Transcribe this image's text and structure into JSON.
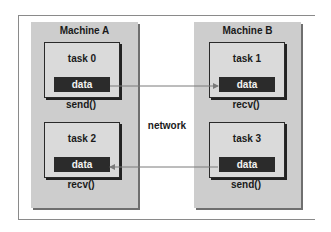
{
  "diagram": {
    "type": "message-passing",
    "network_label": "network",
    "colors": {
      "machine_fill": "#cdcdcd",
      "task_fill": "#dadada",
      "data_fill": "#2b2b2b",
      "arrow": "#7a7a7a"
    },
    "machines": [
      {
        "title": "Machine A",
        "tasks": [
          {
            "title": "task 0",
            "data": "data",
            "call": "send()"
          },
          {
            "title": "task 2",
            "data": "data",
            "call": "recv()"
          }
        ]
      },
      {
        "title": "Machine B",
        "tasks": [
          {
            "title": "task 1",
            "data": "data",
            "call": "recv()"
          },
          {
            "title": "task 3",
            "data": "data",
            "call": "send()"
          }
        ]
      }
    ],
    "edges": [
      {
        "from": "task 0",
        "to": "task 1",
        "direction": "right"
      },
      {
        "from": "task 3",
        "to": "task 2",
        "direction": "left"
      }
    ]
  }
}
